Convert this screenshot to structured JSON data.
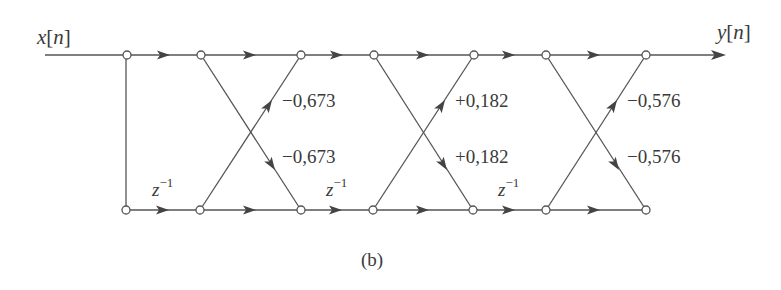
{
  "diagram": {
    "input_label": "x[n]",
    "input_var": "x",
    "input_index": "n",
    "output_label": "y[n]",
    "output_var": "y",
    "output_index": "n",
    "caption": "(b)",
    "delay_label": {
      "base": "z",
      "exponent": "−1"
    },
    "stages": [
      {
        "upper_coefficient": "−0,673",
        "lower_coefficient": "−0,673"
      },
      {
        "upper_coefficient": "+0,182",
        "lower_coefficient": "+0,182"
      },
      {
        "upper_coefficient": "−0,576",
        "lower_coefficient": "−0,576"
      }
    ],
    "colors": {
      "line": "#555555",
      "text": "#3a3a3a",
      "background": "#ffffff"
    }
  }
}
